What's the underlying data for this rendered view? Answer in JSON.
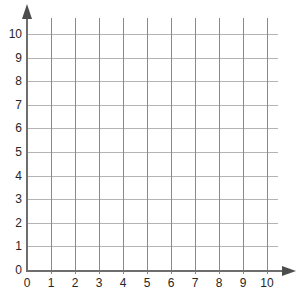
{
  "figure": {
    "kind": "coordinate-grid",
    "title": "",
    "background_color": "#ffffff"
  },
  "chart_data": {
    "type": "scatter",
    "title": "",
    "subtitle": "",
    "xlabel": "",
    "ylabel": "",
    "xlim": [
      0,
      10
    ],
    "ylim": [
      0,
      10
    ],
    "x_ticks": [
      0,
      1,
      2,
      3,
      4,
      5,
      6,
      7,
      8,
      9,
      10
    ],
    "y_ticks": [
      0,
      1,
      2,
      3,
      4,
      5,
      6,
      7,
      8,
      9,
      10
    ],
    "x_tick_labels": [
      "0",
      "1",
      "2",
      "3",
      "4",
      "5",
      "6",
      "7",
      "8",
      "9",
      "10"
    ],
    "y_tick_labels": [
      "0",
      "1",
      "2",
      "3",
      "4",
      "5",
      "6",
      "7",
      "8",
      "9",
      "10"
    ],
    "grid": true,
    "legend": null,
    "series": [],
    "annotations": []
  },
  "style": {
    "vertical_gridline_color": "#8a8a8a",
    "horizontal_gridline_color": "#b4b4b4",
    "axis_color": "#6e6e6e",
    "arrow_color": "#4d4d4d",
    "label_color": "#262626"
  },
  "geometry": {
    "origin_x": 27,
    "origin_y": 270,
    "unit_px_x": 24,
    "unit_px_y": 23.6,
    "h_gridline_overshoot": 11,
    "v_gridline_tick_below": 4,
    "y_axis_arrow_tip_y": 4,
    "x_axis_arrow_tip_x": 296
  }
}
